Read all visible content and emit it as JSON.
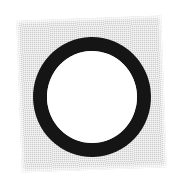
{
  "figure": {
    "caption": "",
    "background_color": "#ffffff",
    "square": {
      "label": "gray-square-patch",
      "fill_color": "#d6d6d6",
      "texture": "halftone-dither",
      "rotation_deg": -2.1,
      "left": 19,
      "top": 18,
      "width": 145,
      "height": 152
    },
    "ring": {
      "label": "black-annulus",
      "stroke_color": "#151515",
      "interior_color": "#ffffff",
      "stroke_width": 14,
      "outer_width": 118,
      "outer_height": 120,
      "center_x": 92,
      "center_y": 97
    }
  }
}
